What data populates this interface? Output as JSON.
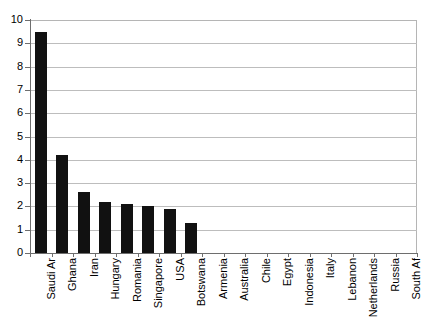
{
  "chart_data": {
    "type": "bar",
    "title": "",
    "subtitle": "",
    "xlabel": "",
    "ylabel": "",
    "ylim": [
      0,
      10
    ],
    "ytick_step": 1,
    "yticks": [
      0,
      1,
      2,
      3,
      4,
      5,
      6,
      7,
      8,
      9,
      10
    ],
    "grid": true,
    "grid_axis": "y",
    "legend": false,
    "legend_position": "none",
    "bar_color": "#111111",
    "grid_color": "#bdbdbd",
    "axis_color": "#6e6e6e",
    "categories": [
      "Saudi Ar",
      "Ghana",
      "Iran",
      "Hungary",
      "Romania",
      "Singapore",
      "USA",
      "Botswana",
      "Armenia",
      "Australia",
      "Chile",
      "Egypt",
      "Indonesia",
      "Italy",
      "Lebanon",
      "Netherlands",
      "Russia",
      "South Af"
    ],
    "values": [
      9.5,
      4.2,
      2.6,
      2.2,
      2.1,
      2.0,
      1.9,
      1.3,
      0,
      0,
      0,
      0,
      0,
      0,
      0,
      0,
      0,
      0
    ]
  }
}
